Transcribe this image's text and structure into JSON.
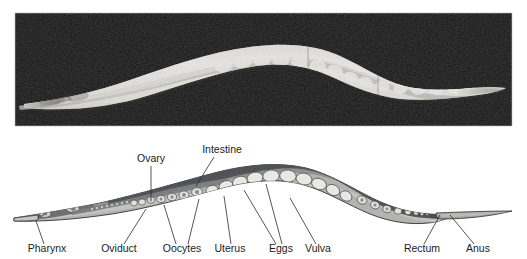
{
  "figure": {
    "panels": [
      {
        "name": "micrograph",
        "kind": "photomicrograph",
        "background_color": "#0d0d0d",
        "subject": "nematode whole body, lateral view, Nomarski DIC"
      },
      {
        "name": "schematic",
        "kind": "line-diagram",
        "subject": "nematode internal organs, lateral view"
      }
    ],
    "colors": {
      "panel_background": "#0d0d0d",
      "worm_bright": "#e8e6e1",
      "worm_mid": "#9a9a96",
      "cuticle_dark": "#4d4f52",
      "body_gray": "#9d9e9c",
      "body_light": "#c9c9c5",
      "egg_fill": "#e3e3df",
      "intestine_dark": "#5e6063",
      "label_text": "#1b1b1b",
      "leader_line": "#2b2b2b"
    },
    "labels_top": [
      {
        "id": "ovary",
        "text": "Ovary",
        "x": 151,
        "y": 161,
        "anchor": "middle"
      },
      {
        "id": "intestine",
        "text": "Intestine",
        "x": 222,
        "y": 152,
        "anchor": "middle"
      }
    ],
    "labels_bottom": [
      {
        "id": "pharynx",
        "text": "Pharynx",
        "x": 47,
        "y": 252,
        "anchor": "middle"
      },
      {
        "id": "oviduct",
        "text": "Oviduct",
        "x": 119,
        "y": 252,
        "anchor": "middle"
      },
      {
        "id": "oocytes",
        "text": "Oocytes",
        "x": 182,
        "y": 252,
        "anchor": "middle"
      },
      {
        "id": "uterus",
        "text": "Uterus",
        "x": 230,
        "y": 252,
        "anchor": "middle"
      },
      {
        "id": "eggs",
        "text": "Eggs",
        "x": 281,
        "y": 252,
        "anchor": "middle"
      },
      {
        "id": "vulva",
        "text": "Vulva",
        "x": 318,
        "y": 252,
        "anchor": "middle"
      },
      {
        "id": "rectum",
        "text": "Rectum",
        "x": 422,
        "y": 252,
        "anchor": "middle"
      },
      {
        "id": "anus",
        "text": "Anus",
        "x": 478,
        "y": 252,
        "anchor": "middle"
      }
    ]
  }
}
